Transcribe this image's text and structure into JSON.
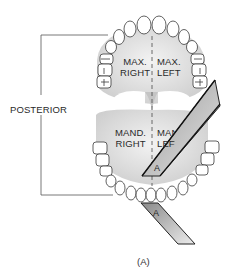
{
  "diagram": {
    "side_label": "POSTERIOR",
    "quadrants": {
      "max_right": {
        "line1": "MAX.",
        "line2": "RIGHT"
      },
      "max_left": {
        "line1": "MAX.",
        "line2": "LEFT"
      },
      "mand_right": {
        "line1": "MAND.",
        "line2": "RIGHT"
      },
      "mand_left": {
        "line1": "MAND.",
        "line2": "LEFT"
      }
    },
    "film_labels": [
      "A",
      "A"
    ],
    "caption": "(A)",
    "colors": {
      "line": "#3a3a3a",
      "palate": "#d9d9d9",
      "film_light": "#e8e8e8",
      "film_dark": "#8f8f8f"
    }
  }
}
